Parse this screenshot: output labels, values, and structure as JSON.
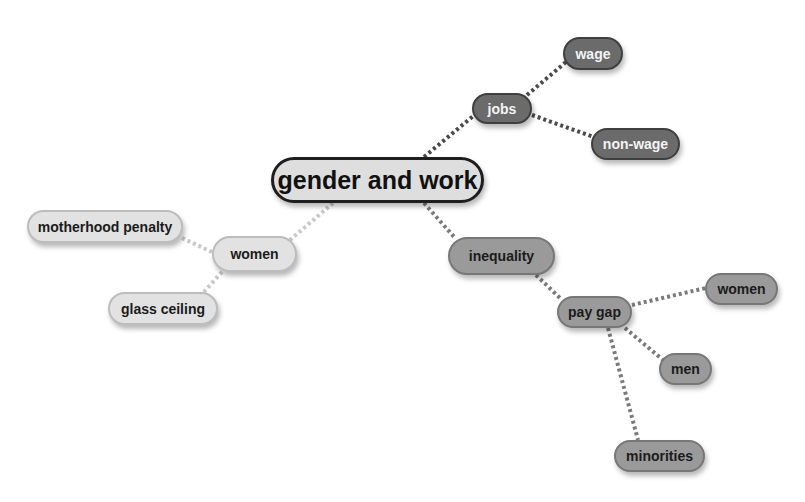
{
  "diagram": {
    "type": "mind-map",
    "root": {
      "id": "root",
      "label": "gender and work"
    },
    "nodes": [
      {
        "id": "jobs",
        "label": "jobs",
        "parent": "root",
        "style": "dark"
      },
      {
        "id": "wage",
        "label": "wage",
        "parent": "jobs",
        "style": "dark"
      },
      {
        "id": "non_wage",
        "label": "non-wage",
        "parent": "jobs",
        "style": "dark"
      },
      {
        "id": "inequality",
        "label": "inequality",
        "parent": "root",
        "style": "mid"
      },
      {
        "id": "pay_gap",
        "label": "pay gap",
        "parent": "inequality",
        "style": "mid"
      },
      {
        "id": "pay_gap_women",
        "label": "women",
        "parent": "pay_gap",
        "style": "mid"
      },
      {
        "id": "men",
        "label": "men",
        "parent": "pay_gap",
        "style": "mid"
      },
      {
        "id": "minorities",
        "label": "minorities",
        "parent": "pay_gap",
        "style": "mid"
      },
      {
        "id": "women",
        "label": "women",
        "parent": "root",
        "style": "light"
      },
      {
        "id": "motherhood_penalty",
        "label": "motherhood penalty",
        "parent": "women",
        "style": "light"
      },
      {
        "id": "glass_ceiling",
        "label": "glass ceiling",
        "parent": "women",
        "style": "light"
      }
    ],
    "colors": {
      "dark_branch": "#6b6b6b",
      "mid_branch": "#9a9a9a",
      "light_branch": "#e2e2e2",
      "root_fill": "#dedede",
      "root_border": "#1e1e1e"
    }
  }
}
